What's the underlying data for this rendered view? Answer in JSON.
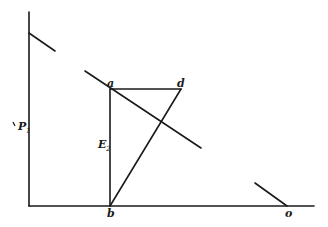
{
  "diagram": {
    "labels": {
      "a": "a",
      "d": "d",
      "b": "b",
      "o": "o",
      "P": "P",
      "P_sub": "1",
      "E": "E",
      "E_sub": "2"
    },
    "colors": {
      "line": "#1a1a1a",
      "background": "#ffffff"
    }
  }
}
